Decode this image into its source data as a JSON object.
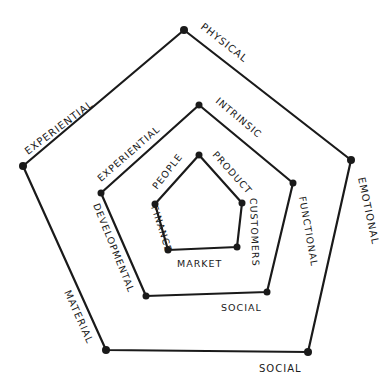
{
  "diagram": {
    "title": "",
    "rings": [
      {
        "name": "outer",
        "labels": {
          "top_right_edge": "PHYSICAL",
          "top_left_edge": "EXPERIENTIAL",
          "right_edge": "EMOTIONAL",
          "bottom_edge": "SOCIAL",
          "left_edge": "MATERIAL"
        }
      },
      {
        "name": "middle",
        "labels": {
          "top_right_edge": "INTRINSIC",
          "top_left_edge": "EXPERIENTIAL",
          "right_edge": "FUNCTIONAL",
          "bottom_edge": "SOCIAL",
          "left_edge": "DEVELOPMENTAL"
        }
      },
      {
        "name": "inner",
        "labels": {
          "top_right_edge": "PRODUCT",
          "top_left_edge": "PEOPLE",
          "right_edge": "CUSTOMERS",
          "bottom_edge": "MARKET",
          "left_edge": "FINANCE"
        }
      }
    ],
    "colors": {
      "ink": "#1a1a1a",
      "background": "#ffffff"
    }
  }
}
